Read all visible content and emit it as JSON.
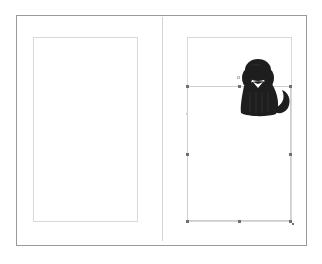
{
  "canvas": {
    "background": "#ffffff",
    "spread_border_color": "#9a9a9a",
    "margin_guide_color": "#d8d8d8",
    "handle_color": "#707070"
  },
  "pages": [
    {
      "name": "left-page",
      "content": "empty"
    },
    {
      "name": "right-page",
      "content": "image-frame"
    }
  ],
  "selection": {
    "object": "dog-image",
    "icon": "dog-icon",
    "fill_color": "#1e1e1e",
    "handles": [
      "top-left",
      "top-center",
      "top-right",
      "middle-left",
      "middle-right",
      "bottom-left",
      "bottom-center",
      "bottom-right"
    ]
  }
}
